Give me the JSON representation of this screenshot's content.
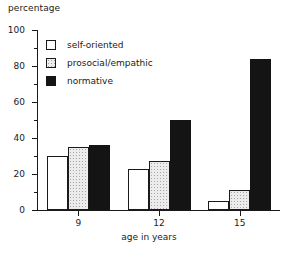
{
  "chart_data": {
    "type": "bar",
    "title": "",
    "ylabel": "percentage",
    "xlabel": "age in years",
    "categories": [
      "9",
      "12",
      "15"
    ],
    "series": [
      {
        "name": "self-oriented",
        "values": [
          30,
          23,
          5
        ],
        "swatch": "white-outline",
        "color": "#ffffff"
      },
      {
        "name": "prosocial/empathic",
        "values": [
          35,
          27,
          11
        ],
        "swatch": "stippled-light",
        "color": "#ececec"
      },
      {
        "name": "normative",
        "values": [
          36,
          50,
          84
        ],
        "swatch": "solid-black",
        "color": "#141414"
      }
    ],
    "ylim": [
      0,
      100
    ],
    "y_ticks_major": [
      0,
      20,
      40,
      60,
      80,
      100
    ],
    "y_tick_labels": [
      "0",
      "20",
      "40",
      "60",
      "80",
      "100"
    ],
    "y_ticks_minor": [
      10,
      30,
      50,
      70,
      90
    ],
    "grid": false,
    "legend_position": "top-left",
    "axis_color": "#1a1a1a"
  }
}
